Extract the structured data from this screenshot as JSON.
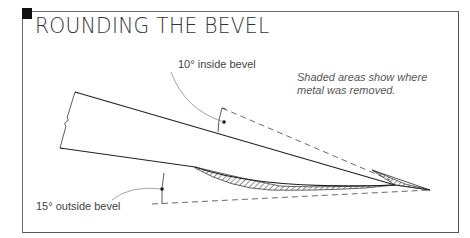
{
  "title": "ROUNDING THE BEVEL",
  "labels": {
    "inside_bevel": "10° inside bevel",
    "outside_bevel": "15° outside bevel"
  },
  "note": {
    "line1": "Shaded areas show where",
    "line2": "metal was removed."
  },
  "colors": {
    "marker": "#111111",
    "line": "#222222",
    "text": "#444444"
  }
}
